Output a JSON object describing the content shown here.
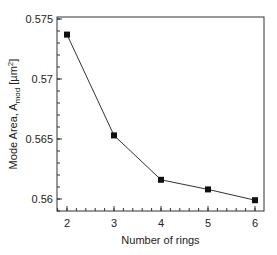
{
  "chart_data": {
    "type": "line",
    "title": "",
    "xlabel": "Number of rings",
    "ylabel": "Mode Area, A_mod [µm²]",
    "ylabel_parts": {
      "main": "Mode Area, A",
      "sub": "mod",
      "unit_pre": " [µm",
      "sup": "2",
      "unit_post": "]"
    },
    "x": [
      2,
      3,
      4,
      5,
      6
    ],
    "series": [
      {
        "name": "Mode Area",
        "values": [
          0.5737,
          0.5653,
          0.5616,
          0.5608,
          0.5599
        ],
        "marker": "square",
        "color": "#111111"
      }
    ],
    "xlim": [
      1.8,
      6.2
    ],
    "ylim": [
      0.559,
      0.5753
    ],
    "xticks": [
      "2",
      "3",
      "4",
      "5",
      "6"
    ],
    "yticks": [
      "0.56",
      "0.565",
      "0.57",
      "0.575"
    ],
    "grid": false,
    "legend": null
  }
}
